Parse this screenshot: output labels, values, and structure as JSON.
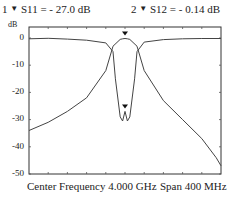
{
  "markers": [
    {
      "id": "1",
      "icon": "marker-triangle-icon",
      "label": "S11 = - 27.0 dB"
    },
    {
      "id": "2",
      "icon": "marker-triangle-icon",
      "label": "S12 = - 0.14 dB"
    }
  ],
  "y_unit": "dB",
  "y_ticks": [
    "0",
    "-10",
    "-20",
    "-30",
    "-40",
    "-50"
  ],
  "footer": {
    "center": "Center Frequency 4.000 GHz",
    "span": "Span 400 MHz"
  },
  "chart_data": {
    "type": "line",
    "title": "",
    "xlabel": "Center Frequency 4.000 GHz, Span 400 MHz",
    "ylabel": "dB",
    "xlim": [
      3.8,
      4.2
    ],
    "ylim": [
      -50,
      4
    ],
    "grid": false,
    "x_ticks_count": 10,
    "series": [
      {
        "name": "S11",
        "x": [
          3.8,
          3.84,
          3.88,
          3.92,
          3.96,
          3.975,
          3.99,
          3.995,
          4.0,
          4.005,
          4.01,
          4.025,
          4.04,
          4.08,
          4.12,
          4.16,
          4.19,
          4.2
        ],
        "values": [
          -34,
          -31,
          -27,
          -22,
          -12,
          -3,
          -0.5,
          -0.3,
          -0.2,
          -0.3,
          -0.5,
          -3,
          -12,
          -23,
          -30,
          -37,
          -44,
          -47
        ]
      },
      {
        "name": "S12",
        "x": [
          3.8,
          3.84,
          3.88,
          3.92,
          3.96,
          3.975,
          3.98,
          3.99,
          3.995,
          4.0,
          4.005,
          4.01,
          4.02,
          4.025,
          4.04,
          4.08,
          4.12,
          4.16,
          4.2
        ],
        "values": [
          -0.3,
          -0.1,
          -0.4,
          -0.8,
          -1.8,
          -5,
          -15,
          -29,
          -30.5,
          -27,
          -30.5,
          -29,
          -15,
          -5,
          -1.5,
          -0.6,
          -0.3,
          -0.2,
          -0.2
        ]
      }
    ],
    "annotations": [
      {
        "marker": "1",
        "trace": "S11",
        "value_db": -27.0,
        "x": 4.0
      },
      {
        "marker": "2",
        "trace": "S12",
        "value_db": -0.14,
        "x": 4.0
      }
    ]
  }
}
